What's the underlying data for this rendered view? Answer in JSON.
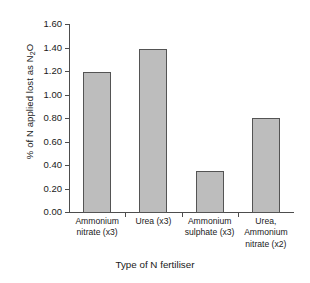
{
  "chart_data": {
    "type": "bar",
    "title": "",
    "categories": [
      "Ammonium nitrate (x3)",
      "Urea (x3)",
      "Ammonium sulphate (x3)",
      "Urea, Ammonium nitrate (x2)"
    ],
    "category_lines": [
      [
        "Ammonium",
        "nitrate (x3)"
      ],
      [
        "Urea (x3)"
      ],
      [
        "Ammonium",
        "sulphate (x3)"
      ],
      [
        "Urea,",
        "Ammonium",
        "nitrate (x2)"
      ]
    ],
    "values": [
      1.2,
      1.4,
      0.36,
      0.81
    ],
    "xlabel": "Type of N fertiliser",
    "ylabel": "% of N applied lost as N",
    "ylabel_sub": "2",
    "ylabel_tail": "O",
    "ylabel_full": "% of N applied lost as N2O",
    "ylim": [
      0.0,
      1.6
    ],
    "ytick_values": [
      0.0,
      0.2,
      0.4,
      0.6,
      0.8,
      1.0,
      1.2,
      1.4,
      1.6
    ],
    "ytick_labels": [
      "0.00",
      "0.20",
      "0.40",
      "0.60",
      "0.80",
      "1.00",
      "1.20",
      "1.40",
      "1.60"
    ],
    "grid": false,
    "legend": false,
    "bar_fill_color": "#bdbdbd",
    "bar_edge_color": "#545454",
    "axis_color": "#4d4d4d",
    "background_color": "#ffffff"
  }
}
